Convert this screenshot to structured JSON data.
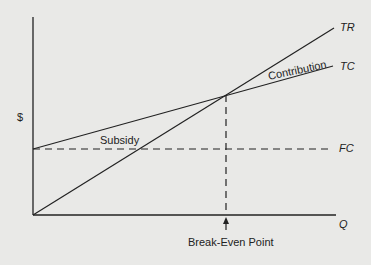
{
  "diagram": {
    "y_axis_label": "$",
    "x_axis_label": "Q",
    "lines": {
      "tr": "TR",
      "tc": "TC",
      "fc": "FC"
    },
    "regions": {
      "contribution": "Contribution",
      "subsidy": "Subsidy"
    },
    "break_even_label": "Break-Even Point",
    "colors": {
      "background": "#e9e9e7",
      "ink": "#222222"
    }
  }
}
